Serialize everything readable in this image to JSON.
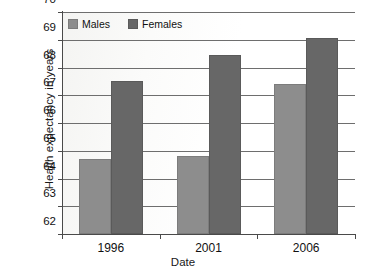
{
  "chart_data": {
    "type": "bar",
    "title": "",
    "categories": [
      "1996",
      "2001",
      "2006"
    ],
    "series": [
      {
        "name": "Males",
        "color": "#8d8d8d",
        "values": [
          64.7,
          64.8,
          67.4
        ]
      },
      {
        "name": "Females",
        "color": "#676767",
        "values": [
          67.5,
          68.45,
          69.05
        ]
      }
    ],
    "xlabel": "Date",
    "ylabel": "Health expectancy in years",
    "ylim": [
      62,
      70
    ],
    "ytick_labels": [
      "70",
      "69",
      "68",
      "67",
      "66",
      "65",
      "64",
      "63",
      "62"
    ],
    "ytick_values": [
      70,
      69,
      68,
      67,
      66,
      65,
      64,
      63,
      62
    ],
    "grid": "horizontal",
    "legend_position": "top-left-inside",
    "legend_entries": [
      "Males",
      "Females"
    ]
  },
  "axes": {
    "y_title": "Health expectancy in years",
    "x_title": "Date"
  },
  "legend": {
    "males_label": "Males",
    "females_label": "Females"
  },
  "y_ticks": [
    {
      "label": "70"
    },
    {
      "label": "69"
    },
    {
      "label": "68"
    },
    {
      "label": "67"
    },
    {
      "label": "66"
    },
    {
      "label": "65"
    },
    {
      "label": "64"
    },
    {
      "label": "63"
    },
    {
      "label": "62"
    }
  ],
  "x_ticks": [
    {
      "label": "1996"
    },
    {
      "label": "2001"
    },
    {
      "label": "2006"
    }
  ]
}
